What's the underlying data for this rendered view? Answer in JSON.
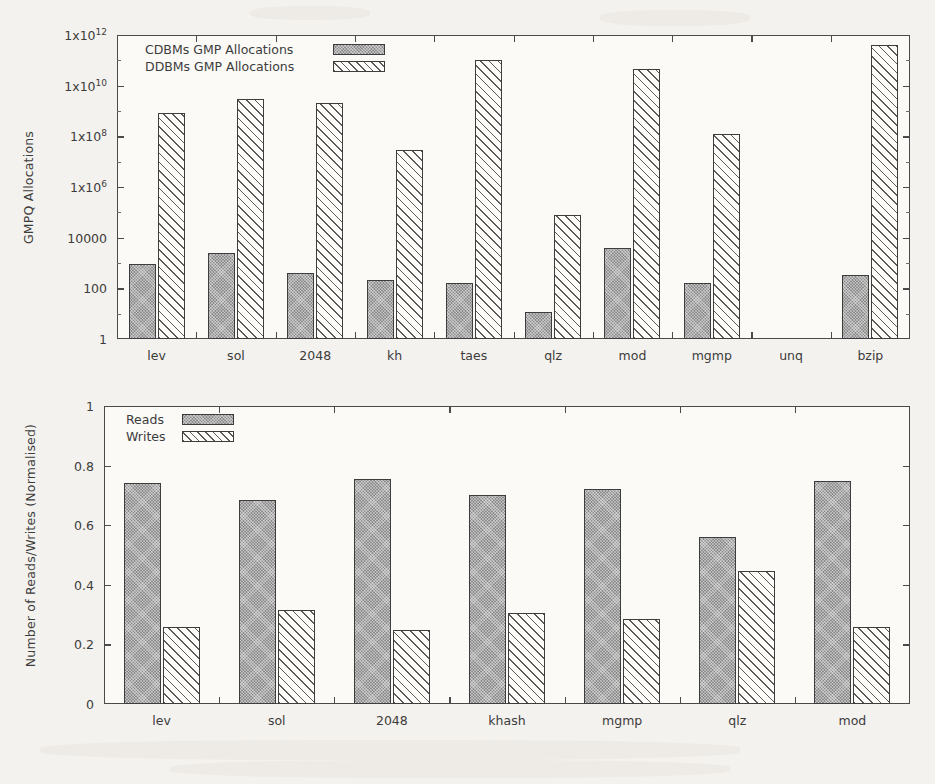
{
  "figure": {
    "background_color": "#f4f2ee",
    "bar_solid_color": "#8c8c8c",
    "bar_hatch_color": "#fdfcf9",
    "axis_color": "#4a4a4a"
  },
  "chart_data": [
    {
      "id": "gmpq-allocations-chart",
      "type": "bar",
      "title": "",
      "xlabel": "",
      "ylabel": "GMPQ Allocations",
      "yscale": "log",
      "ylim": [
        1,
        1000000000000
      ],
      "ytick_labels": [
        "1x10 12",
        "1x10 10",
        "1x10 8",
        "1x10 6",
        "10000",
        "100",
        "1"
      ],
      "ytick_mantissa": [
        "1x10",
        "1x10",
        "1x10",
        "1x10",
        "10000",
        "100",
        "1"
      ],
      "ytick_exponent": [
        "12",
        "10",
        "8",
        "6",
        "",
        "",
        ""
      ],
      "ytick_values": [
        1000000000000,
        10000000000,
        100000000,
        1000000,
        10000,
        100,
        1
      ],
      "grid": false,
      "legend_position": "top-left",
      "categories": [
        "lev",
        "sol",
        "2048",
        "kh",
        "taes",
        "qlz",
        "mod",
        "mgmp",
        "unq",
        "bzip"
      ],
      "series": [
        {
          "name": "CDBMs GMP Allocations",
          "pattern": "solid",
          "values": [
            900,
            2500,
            400,
            220,
            160,
            12,
            4000,
            160,
            0,
            330
          ]
        },
        {
          "name": "DDBMs GMP Allocations",
          "pattern": "hatch",
          "values": [
            800000000,
            3000000000,
            2000000000,
            30000000,
            100000000000,
            80000,
            45000000000,
            120000000,
            0,
            400000000000
          ]
        }
      ]
    },
    {
      "id": "reads-writes-chart",
      "type": "bar",
      "title": "",
      "xlabel": "",
      "ylabel": "Number of Reads/Writes (Normalised)",
      "yscale": "linear",
      "ylim": [
        0,
        1
      ],
      "ytick_labels": [
        "1",
        "0.8",
        "0.6",
        "0.4",
        "0.2",
        "0"
      ],
      "ytick_values": [
        1,
        0.8,
        0.6,
        0.4,
        0.2,
        0
      ],
      "grid": false,
      "legend_position": "top-left",
      "categories": [
        "lev",
        "sol",
        "2048",
        "khash",
        "mgmp",
        "qlz",
        "mod"
      ],
      "series": [
        {
          "name": "Reads",
          "pattern": "solid",
          "values": [
            0.74,
            0.685,
            0.755,
            0.7,
            0.72,
            0.56,
            0.75
          ]
        },
        {
          "name": "Writes",
          "pattern": "hatch",
          "values": [
            0.26,
            0.315,
            0.25,
            0.305,
            0.285,
            0.445,
            0.26
          ]
        }
      ]
    }
  ]
}
